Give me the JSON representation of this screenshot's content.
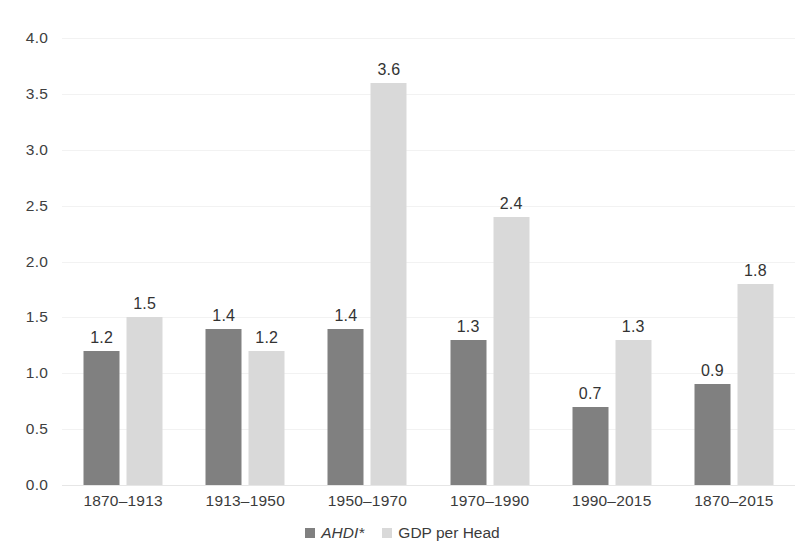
{
  "chart_data": {
    "type": "bar",
    "title": "",
    "subtitle": "",
    "xlabel": "",
    "ylabel": "",
    "ylim": [
      0.0,
      4.0
    ],
    "ytick_step": 0.5,
    "ytick_labels": [
      "4.0",
      "3.5",
      "3.0",
      "2.5",
      "2.0",
      "1.5",
      "1.0",
      "0.5",
      "0.0"
    ],
    "ytick_values": [
      4.0,
      3.5,
      3.0,
      2.5,
      2.0,
      1.5,
      1.0,
      0.5,
      0.0
    ],
    "grid": true,
    "grid_axis": "y",
    "legend_position": "bottom",
    "categories": [
      "1870–1913",
      "1913–1950",
      "1950–1970",
      "1970–1990",
      "1990–2015",
      "1870–2015"
    ],
    "series": [
      {
        "name": "AHDI*",
        "name_italic": true,
        "color": "#808080",
        "values": [
          1.2,
          1.4,
          1.4,
          1.3,
          0.7,
          0.9
        ],
        "labels": [
          "1.2",
          "1.4",
          "1.4",
          "1.3",
          "0.7",
          "0.9"
        ]
      },
      {
        "name": "GDP per Head",
        "name_italic": false,
        "color": "#d9d9d9",
        "values": [
          1.5,
          1.2,
          3.6,
          2.4,
          1.3,
          1.8
        ],
        "labels": [
          "1.5",
          "1.2",
          "3.6",
          "2.4",
          "1.3",
          "1.8"
        ]
      }
    ]
  },
  "colors": {
    "series_ahdi": "#808080",
    "series_gdp": "#d9d9d9",
    "gridline": "#f2f2f2",
    "text": "#3b3b3b",
    "background": "#ffffff"
  }
}
